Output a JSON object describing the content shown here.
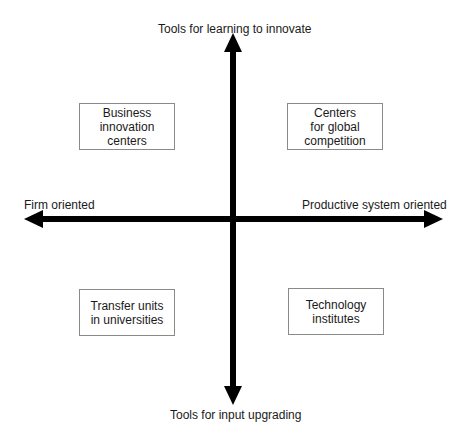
{
  "diagram": {
    "type": "quadrant",
    "axes": {
      "top": "Tools for learning to innovate",
      "bottom": "Tools for input upgrading",
      "left": "Firm oriented",
      "right": "Productive system oriented"
    },
    "quadrants": {
      "top_left": "Business\ninnovation\ncenters",
      "top_right": "Centers\nfor global\ncompetition",
      "bottom_left": "Transfer units\nin universities",
      "bottom_right": "Technology\ninstitutes"
    },
    "colors": {
      "axis": "#000000",
      "box_border": "#8a8a8a",
      "text": "#1a1a1a"
    }
  }
}
